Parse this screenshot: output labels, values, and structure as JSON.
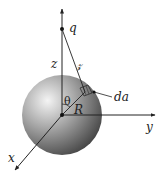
{
  "figure": {
    "labels": {
      "charge": "q",
      "z_axis_distance": "z",
      "separation": "𝓏",
      "theta": "θ",
      "radius": "R",
      "area_element": "da",
      "x_axis": "x",
      "y_axis": "y"
    },
    "colors": {
      "line": "#222222",
      "sphere_light": "#f2f2f2",
      "sphere_mid": "#9a9a9a",
      "sphere_dark": "#4a4a4a",
      "background": "#ffffff"
    }
  }
}
